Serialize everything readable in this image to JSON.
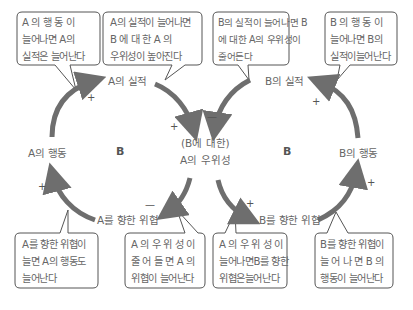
{
  "diagram": {
    "type": "causal-loop-diagram",
    "loops": [
      {
        "id": "left",
        "label": "B"
      },
      {
        "id": "right",
        "label": "B"
      }
    ],
    "nodes": {
      "a_performance": "A의 실적",
      "a_action": "A의 행동",
      "a_superiority_line1": "(B에 대한)",
      "a_superiority_line2": "A의 우위성",
      "threat_to_a": "A를 향한 위협",
      "b_performance": "B의 실적",
      "b_action": "B의 행동",
      "threat_to_b": "B를 향한 위협"
    },
    "links": [
      {
        "from": "A의 행동",
        "to": "A의 실적",
        "sign": "+"
      },
      {
        "from": "A의 실적",
        "to": "(B에 대한) A의 우위성",
        "sign": "+"
      },
      {
        "from": "(B에 대한) A의 우위성",
        "to": "A를 향한 위협",
        "sign": "—"
      },
      {
        "from": "A를 향한 위협",
        "to": "A의 행동",
        "sign": "+"
      },
      {
        "from": "B의 실적",
        "to": "(B에 대한) A의 우위성",
        "sign": "—"
      },
      {
        "from": "(B에 대한) A의 우위성",
        "to": "B를 향한 위협",
        "sign": "+"
      },
      {
        "from": "B를 향한 위협",
        "to": "B의 행동",
        "sign": "+"
      },
      {
        "from": "B의 행동",
        "to": "B의 실적",
        "sign": "+"
      }
    ],
    "bubbles": [
      {
        "id": "top-1",
        "lines": [
          "A 의  행 동 이",
          "늘어나면  A의",
          "실적은 늘어난다"
        ]
      },
      {
        "id": "top-2",
        "lines": [
          "A의 실적이 늘어나면",
          "B 에  대 한  A 의",
          "우위성이 높아진다"
        ]
      },
      {
        "id": "top-3",
        "lines": [
          "B의 실적이 늘어나면 B",
          "에 대한 A의 우위성이",
          "줄어든다"
        ]
      },
      {
        "id": "top-4",
        "lines": [
          "B 의  행 동 이",
          "늘어나면 B의",
          "실적이늘어난다"
        ]
      },
      {
        "id": "bottom-1",
        "lines": [
          "A를 향한 위협이",
          "늘면 A의 행동도",
          "늘어난다"
        ]
      },
      {
        "id": "bottom-2",
        "lines": [
          "A 의  우 위 성 이",
          "줄 어 들 면  A 의",
          "위협이 늘어난다"
        ]
      },
      {
        "id": "bottom-3",
        "lines": [
          "A 의  우 위 성 이",
          "늘어나면B를 향한",
          "위협은늘어난다"
        ]
      },
      {
        "id": "bottom-4",
        "lines": [
          "B를 향한 위협이",
          "늘 어 나 면  B 의",
          "행동이 늘어난다"
        ]
      }
    ],
    "signs": {
      "plus": "+",
      "minus": "—"
    },
    "colors": {
      "arrow": "#6e6e6e",
      "bubble_border": "#555555",
      "text": "#666666"
    }
  }
}
